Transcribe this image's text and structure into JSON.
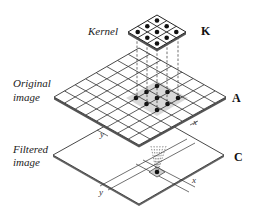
{
  "labels": {
    "kernel": "Kernel",
    "kernel_letter": "K",
    "original_line1": "Original",
    "original_line2": "image",
    "original_letter": "A",
    "filtered_line1": "Filtered",
    "filtered_line2": "image",
    "filtered_letter": "C",
    "axis_x_a": "x",
    "axis_y_a": "y",
    "axis_x_c": "x",
    "axis_y_c": "y"
  },
  "kernel": {
    "size": 3,
    "dots": 9
  },
  "original_image": {
    "grid": 8,
    "highlighted_region": "3x3"
  },
  "filtered_image": {
    "highlighted_pixel": 1
  },
  "colors": {
    "line": "#333333",
    "dot": "#111111",
    "highlight": "#d8d8d8",
    "edge": "#555555"
  }
}
